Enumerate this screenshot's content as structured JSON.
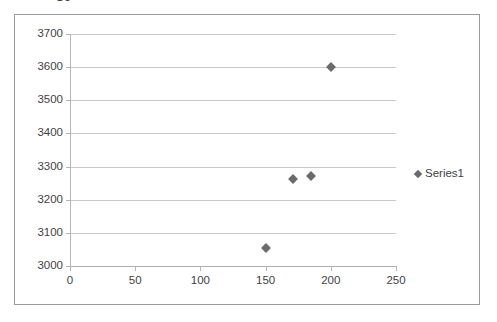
{
  "title_fragment": "Sc",
  "legend": {
    "position": "right",
    "entries": [
      {
        "label": "Series1",
        "marker": "diamond-marker",
        "color": "#6b6b6b"
      }
    ]
  },
  "colors": {
    "marker": "#6b6b6b",
    "gridline": "#c8c8c8",
    "axis": "#b5b5b5",
    "frame_border": "#9a9a9a",
    "text": "#3f3f3f",
    "background": "#ffffff"
  },
  "chart_data": {
    "type": "scatter",
    "title": "",
    "xlabel": "",
    "ylabel": "",
    "xlim": [
      0,
      250
    ],
    "ylim": [
      3000,
      3700
    ],
    "xticks": [
      0,
      50,
      100,
      150,
      200,
      250
    ],
    "yticks": [
      3000,
      3100,
      3200,
      3300,
      3400,
      3500,
      3600,
      3700
    ],
    "xtick_labels": [
      "0",
      "50",
      "100",
      "150",
      "200",
      "250"
    ],
    "ytick_labels": [
      "3000",
      "3100",
      "3200",
      "3300",
      "3400",
      "3500",
      "3600",
      "3700"
    ],
    "grid": {
      "horizontal": true,
      "vertical": false
    },
    "legend_position": "right",
    "series": [
      {
        "name": "Series1",
        "marker": "diamond",
        "color": "#6b6b6b",
        "points": [
          {
            "x": 150,
            "y": 3055
          },
          {
            "x": 171,
            "y": 3262
          },
          {
            "x": 185,
            "y": 3272
          },
          {
            "x": 200,
            "y": 3600
          }
        ]
      }
    ]
  }
}
